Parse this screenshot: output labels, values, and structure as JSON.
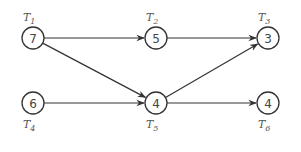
{
  "diagram": {
    "type": "task-precedence-graph",
    "nodes": [
      {
        "id": "T1",
        "label": "T",
        "sub": "1",
        "value": "7",
        "x": 33,
        "y": 38,
        "label_pos": "above"
      },
      {
        "id": "T2",
        "label": "T",
        "sub": "2",
        "value": "5",
        "x": 156,
        "y": 38,
        "label_pos": "above"
      },
      {
        "id": "T3",
        "label": "T",
        "sub": "3",
        "value": "3",
        "x": 268,
        "y": 38,
        "label_pos": "above"
      },
      {
        "id": "T4",
        "label": "T",
        "sub": "4",
        "value": "6",
        "x": 33,
        "y": 103,
        "label_pos": "below"
      },
      {
        "id": "T5",
        "label": "T",
        "sub": "5",
        "value": "4",
        "x": 156,
        "y": 103,
        "label_pos": "below"
      },
      {
        "id": "T6",
        "label": "T",
        "sub": "6",
        "value": "4",
        "x": 268,
        "y": 103,
        "label_pos": "below"
      }
    ],
    "edges": [
      {
        "from": "T1",
        "to": "T2"
      },
      {
        "from": "T1",
        "to": "T5"
      },
      {
        "from": "T2",
        "to": "T3"
      },
      {
        "from": "T4",
        "to": "T5"
      },
      {
        "from": "T5",
        "to": "T3"
      },
      {
        "from": "T5",
        "to": "T6"
      }
    ],
    "colors": {
      "stroke": "#333333",
      "text": "#444444"
    }
  }
}
